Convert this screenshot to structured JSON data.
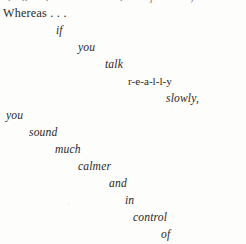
{
  "page": {
    "background_color": "#fdfdfc",
    "text_color": "#2b2927",
    "width": 246,
    "height": 244,
    "clipped_top_line": ". .  ..                                  .  .        .  ."
  },
  "poem": {
    "opening": {
      "text": "Whereas . . .",
      "style": "roman",
      "left": 3,
      "top": 8
    },
    "lines": [
      {
        "text": "if",
        "style": "italic",
        "left": 56,
        "top": 25
      },
      {
        "text": "you",
        "style": "italic",
        "left": 78,
        "top": 42
      },
      {
        "text": "talk",
        "style": "italic",
        "left": 105,
        "top": 59
      },
      {
        "text": "r-e-a-l-l-y",
        "style": "spaced",
        "left": 128,
        "top": 76
      },
      {
        "text": "slowly,",
        "style": "italic",
        "left": 166,
        "top": 93
      },
      {
        "text": "you",
        "style": "italic",
        "left": 6,
        "top": 110
      },
      {
        "text": "sound",
        "style": "italic",
        "left": 29,
        "top": 127
      },
      {
        "text": "much",
        "style": "italic",
        "left": 55,
        "top": 144
      },
      {
        "text": "calmer",
        "style": "italic",
        "left": 78,
        "top": 161
      },
      {
        "text": "and",
        "style": "italic",
        "left": 109,
        "top": 178
      },
      {
        "text": "in",
        "style": "italic",
        "left": 125,
        "top": 195
      },
      {
        "text": "control",
        "style": "italic",
        "left": 133,
        "top": 212
      },
      {
        "text": "of",
        "style": "italic",
        "left": 161,
        "top": 229
      },
      {
        "text": "the",
        "style": "italic",
        "left": 175,
        "top": 246
      },
      {
        "text": "situation.",
        "style": "italic",
        "left": 190,
        "top": 263
      }
    ]
  }
}
